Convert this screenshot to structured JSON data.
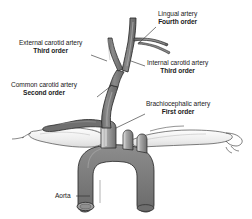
{
  "figure": {
    "background_color": "#ffffff",
    "line_color": "#2b2b2b",
    "vessel_fill": "#808080",
    "vessel_fill_dark": "#6e6e6e",
    "bone_fill": "#f2f2f2",
    "text_color": "#1a1a1a"
  },
  "labels": {
    "lingual": {
      "name": "Lingual artery",
      "order": "Fourth order"
    },
    "external_carotid": {
      "name": "External carotid artery",
      "order": "Third order"
    },
    "internal_carotid": {
      "name": "Internal carotid artery",
      "order": "Third order"
    },
    "common_carotid": {
      "name": "Common carotid artery",
      "order": "Second order"
    },
    "brachiocephalic": {
      "name": "Brachiocephalic artery",
      "order": "First order"
    },
    "aorta": {
      "name": "Aorta"
    }
  }
}
